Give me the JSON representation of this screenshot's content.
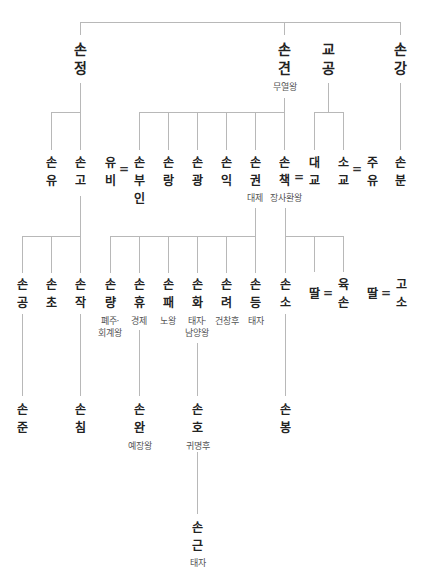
{
  "diagram_type": "family-tree",
  "generation1": [
    {
      "id": "sonjeong",
      "chars": [
        "손",
        "정"
      ],
      "title": ""
    },
    {
      "id": "songyeon",
      "chars": [
        "손",
        "견"
      ],
      "title": "무열왕"
    },
    {
      "id": "gyogong",
      "chars": [
        "교",
        "공"
      ],
      "title": ""
    },
    {
      "id": "songang",
      "chars": [
        "손",
        "강"
      ],
      "title": ""
    }
  ],
  "generation2": [
    {
      "id": "sonyu",
      "chars": [
        "손",
        "유"
      ],
      "title": ""
    },
    {
      "id": "songo",
      "chars": [
        "손",
        "고"
      ],
      "title": ""
    },
    {
      "id": "yubi",
      "chars": [
        "유",
        "비"
      ],
      "title": ""
    },
    {
      "id": "sonbuin",
      "chars": [
        "손",
        "부",
        "인"
      ],
      "title": ""
    },
    {
      "id": "sonrang",
      "chars": [
        "손",
        "랑"
      ],
      "title": ""
    },
    {
      "id": "songwang",
      "chars": [
        "손",
        "광"
      ],
      "title": ""
    },
    {
      "id": "sonik",
      "chars": [
        "손",
        "익"
      ],
      "title": ""
    },
    {
      "id": "songwon",
      "chars": [
        "손",
        "권"
      ],
      "title": "대제"
    },
    {
      "id": "sonchaek",
      "chars": [
        "손",
        "책"
      ],
      "title": "장사환왕"
    },
    {
      "id": "daegyo",
      "chars": [
        "대",
        "교"
      ],
      "title": ""
    },
    {
      "id": "sogyo",
      "chars": [
        "소",
        "교"
      ],
      "title": ""
    },
    {
      "id": "juyu",
      "chars": [
        "주",
        "유"
      ],
      "title": ""
    },
    {
      "id": "sonbun",
      "chars": [
        "손",
        "분"
      ],
      "title": ""
    }
  ],
  "generation3": [
    {
      "id": "songong",
      "chars": [
        "손",
        "공"
      ],
      "title": ""
    },
    {
      "id": "sonchyo",
      "chars": [
        "손",
        "초"
      ],
      "title": ""
    },
    {
      "id": "sonjak",
      "chars": [
        "손",
        "작"
      ],
      "title": ""
    },
    {
      "id": "sonryang",
      "chars": [
        "손",
        "량"
      ],
      "title": "폐주·\n회계왕",
      "title_lines": [
        "폐주·",
        "회계왕"
      ]
    },
    {
      "id": "sonhyu",
      "chars": [
        "손",
        "휴"
      ],
      "title": "경제"
    },
    {
      "id": "sonpae",
      "chars": [
        "손",
        "패"
      ],
      "title": "노왕"
    },
    {
      "id": "sonhwa",
      "chars": [
        "손",
        "화"
      ],
      "title": "태자·\n남양왕",
      "title_lines": [
        "태자·",
        "남양왕"
      ]
    },
    {
      "id": "sonryeo",
      "chars": [
        "손",
        "려"
      ],
      "title": "건창후"
    },
    {
      "id": "sondeung",
      "chars": [
        "손",
        "등"
      ],
      "title": "태자"
    },
    {
      "id": "sonso",
      "chars": [
        "손",
        "소"
      ],
      "title": ""
    },
    {
      "id": "ttal1",
      "chars": [
        "딸"
      ],
      "title": ""
    },
    {
      "id": "yukson",
      "chars": [
        "육",
        "손"
      ],
      "title": ""
    },
    {
      "id": "ttal2",
      "chars": [
        "딸"
      ],
      "title": ""
    },
    {
      "id": "goso",
      "chars": [
        "고",
        "소"
      ],
      "title": ""
    }
  ],
  "generation4": [
    {
      "id": "sonjun",
      "chars": [
        "손",
        "준"
      ],
      "title": ""
    },
    {
      "id": "sonchim",
      "chars": [
        "손",
        "침"
      ],
      "title": ""
    },
    {
      "id": "sonwan",
      "chars": [
        "손",
        "완"
      ],
      "title": "예장왕"
    },
    {
      "id": "sonho",
      "chars": [
        "손",
        "호"
      ],
      "title": "귀명후"
    },
    {
      "id": "sonbong",
      "chars": [
        "손",
        "봉"
      ],
      "title": ""
    }
  ],
  "generation5": [
    {
      "id": "songeun",
      "chars": [
        "손",
        "근"
      ],
      "title": "태자"
    }
  ],
  "marriage_symbol": "=",
  "colors": {
    "line": "#b8b8b8",
    "name": "#222222",
    "title": "#555555",
    "background": "#ffffff"
  }
}
